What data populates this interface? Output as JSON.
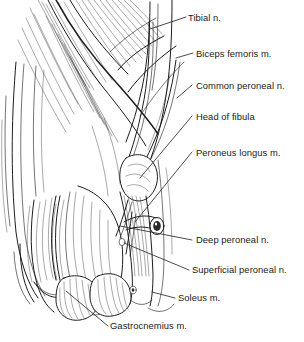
{
  "figure": {
    "background_color": "#ffffff",
    "ink_color": "#1d1d1d",
    "label_color": "#1a1a1a",
    "width": 304,
    "height": 342
  },
  "labels": [
    {
      "id": "tibial-nerve",
      "text": "Tibial n.",
      "x": 188,
      "y": 21,
      "leader": "M186,17 L150,29"
    },
    {
      "id": "biceps-femoris",
      "text": "Biceps femoris m.",
      "x": 196,
      "y": 57,
      "leader": "M193,53 L176,58"
    },
    {
      "id": "common-peroneal-nerve",
      "text": "Common peroneal n.",
      "x": 196,
      "y": 89,
      "leader": "M192,85 L177,98"
    },
    {
      "id": "head-of-fibula",
      "text": "Head of fibula",
      "x": 196,
      "y": 120,
      "leader": "M192,116 L140,178"
    },
    {
      "id": "peroneus-longus",
      "text": "Peroneus longus m.",
      "x": 196,
      "y": 156,
      "leader": "M192,152 L135,222"
    },
    {
      "id": "deep-peroneal-nerve",
      "text": "Deep peroneal n.",
      "x": 196,
      "y": 243,
      "leader": "M192,240 L120,226"
    },
    {
      "id": "superficial-peroneal-nerve",
      "text": "Superficial peroneal n.",
      "x": 192,
      "y": 273,
      "leader": "M189,270 L124,243"
    },
    {
      "id": "soleus",
      "text": "Soleus m.",
      "x": 178,
      "y": 301,
      "leader": "M175,298 L152,292"
    },
    {
      "id": "gastrocnemius",
      "text": "Gastrocnemius m.",
      "x": 110,
      "y": 329,
      "leader": "M108,326 L66,291"
    }
  ],
  "structures": [
    {
      "id": "biceps-femoris-muscle",
      "name": "Biceps femoris m."
    },
    {
      "id": "popliteal-fossa",
      "name": "Popliteal fossa"
    },
    {
      "id": "tibial-nerve-trunk",
      "name": "Tibial n."
    },
    {
      "id": "common-peroneal-nerve-trunk",
      "name": "Common peroneal n."
    },
    {
      "id": "fibular-head",
      "name": "Head of fibula"
    },
    {
      "id": "peroneus-longus-muscle",
      "name": "Peroneus longus m."
    },
    {
      "id": "cut-nerve-end",
      "name": "Cut nerve end"
    },
    {
      "id": "soleus-muscle",
      "name": "Soleus m."
    },
    {
      "id": "gastrocnemius-lateral-head",
      "name": "Gastrocnemius m. lateral head"
    },
    {
      "id": "gastrocnemius-medial-head",
      "name": "Gastrocnemius m. medial head"
    },
    {
      "id": "skin-flap",
      "name": "Reflected skin flap"
    }
  ]
}
